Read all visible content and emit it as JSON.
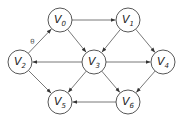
{
  "diagram": {
    "type": "directed-graph",
    "colors": {
      "edge": "#555555",
      "node_stroke": "#444444",
      "node_fill": "#ffffff",
      "text": "#222222"
    },
    "nodes": [
      {
        "id": "v0",
        "letter": "V",
        "sub": "0"
      },
      {
        "id": "v1",
        "letter": "V",
        "sub": "1"
      },
      {
        "id": "v2",
        "letter": "V",
        "sub": "2"
      },
      {
        "id": "v3",
        "letter": "V",
        "sub": "3"
      },
      {
        "id": "v4",
        "letter": "V",
        "sub": "4"
      },
      {
        "id": "v5",
        "letter": "V",
        "sub": "5"
      },
      {
        "id": "v6",
        "letter": "V",
        "sub": "6"
      }
    ],
    "edges": [
      {
        "from": "v2",
        "to": "v0",
        "label": "θ"
      },
      {
        "from": "v0",
        "to": "v1",
        "label": ""
      },
      {
        "from": "v0",
        "to": "v3",
        "label": ""
      },
      {
        "from": "v1",
        "to": "v3",
        "label": ""
      },
      {
        "from": "v1",
        "to": "v4",
        "label": ""
      },
      {
        "from": "v3",
        "to": "v2",
        "label": ""
      },
      {
        "from": "v3",
        "to": "v4",
        "label": ""
      },
      {
        "from": "v3",
        "to": "v5",
        "label": ""
      },
      {
        "from": "v3",
        "to": "v6",
        "label": ""
      },
      {
        "from": "v2",
        "to": "v5",
        "label": ""
      },
      {
        "from": "v4",
        "to": "v6",
        "label": ""
      },
      {
        "from": "v6",
        "to": "v5",
        "label": ""
      }
    ]
  }
}
